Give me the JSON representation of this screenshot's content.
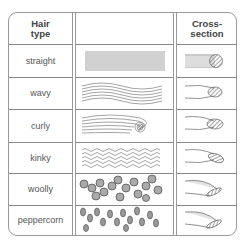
{
  "table": {
    "headers": {
      "hair_type": "Hair\ntype",
      "pattern": "",
      "cross_section": "Cross-\nsection"
    },
    "header_line1": "Hair",
    "header_line2": "type",
    "cs_line1": "Cross-",
    "cs_line2": "section",
    "rows": [
      {
        "type": "straight",
        "cross_section_shape": "round"
      },
      {
        "type": "wavy",
        "cross_section_shape": "oval"
      },
      {
        "type": "curly",
        "cross_section_shape": "oval"
      },
      {
        "type": "kinky",
        "cross_section_shape": "flat-oval"
      },
      {
        "type": "woolly",
        "cross_section_shape": "flat-elliptical"
      },
      {
        "type": "peppercorn",
        "cross_section_shape": "flat-elliptical"
      }
    ]
  },
  "colors": {
    "line": "#999999",
    "text": "#555555",
    "hatch": "#777777"
  }
}
